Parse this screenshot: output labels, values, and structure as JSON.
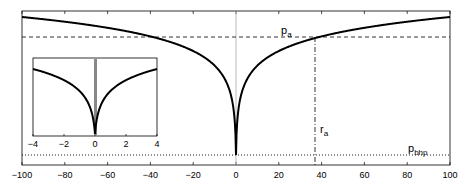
{
  "chart_data": [
    {
      "type": "line",
      "role": "main",
      "title": "",
      "xlabel": "",
      "ylabel": "",
      "xlim": [
        -100,
        100
      ],
      "x_ticks": [
        -100,
        -80,
        -60,
        -40,
        -20,
        0,
        20,
        40,
        60,
        80,
        100
      ],
      "x_tick_labels": [
        "−100",
        "−80",
        "−60",
        "−40",
        "−20",
        "0",
        "20",
        "40",
        "60",
        "80",
        "100"
      ],
      "y_ticks": [],
      "grid": false,
      "legend": null,
      "series": [
        {
          "name": "pressure profile",
          "style": "solid",
          "color": "#000000",
          "description": "logarithmic cone of depression symmetric about x=0, reaching minimum at x=0",
          "x": [
            -100,
            -80,
            -60,
            -40,
            -20,
            -10,
            -5,
            -1,
            0,
            1,
            5,
            10,
            20,
            40,
            60,
            80,
            100
          ],
          "y_rel": [
            0.92,
            0.86,
            0.78,
            0.67,
            0.5,
            0.35,
            0.2,
            0.05,
            0.0,
            0.05,
            0.2,
            0.35,
            0.5,
            0.67,
            0.78,
            0.86,
            0.92
          ]
        },
        {
          "name": "p_a",
          "style": "dashed",
          "color": "#000000",
          "y_rel": 0.83
        },
        {
          "name": "p_bhp",
          "style": "dotted",
          "color": "#000000",
          "y_rel": 0.06
        },
        {
          "name": "r_a",
          "style": "dashdot-vertical",
          "color": "#000000",
          "x": 37
        },
        {
          "name": "well axis",
          "style": "thin-vertical",
          "color": "#999999",
          "x": 0
        }
      ],
      "annotations": [
        {
          "text": "p",
          "sub": "a",
          "x": 23,
          "y_rel": 0.86
        },
        {
          "text": "r",
          "sub": "a",
          "x": 39,
          "y_rel": 0.18
        },
        {
          "text": "p",
          "sub": "bhp",
          "x": 84,
          "y_rel": 0.09
        }
      ]
    },
    {
      "type": "line",
      "role": "inset",
      "xlim": [
        -4,
        4
      ],
      "x_ticks": [
        -4,
        -2,
        0,
        2,
        4
      ],
      "x_tick_labels": [
        "−4",
        "−2",
        "0",
        "2",
        "4"
      ],
      "series": [
        {
          "name": "pressure profile (zoom)",
          "style": "solid",
          "color": "#000000",
          "x": [
            -4,
            -3,
            -2,
            -1,
            -0.5,
            -0.2,
            0,
            0.2,
            0.5,
            1,
            2,
            3,
            4
          ]
        },
        {
          "name": "wellbore",
          "style": "thick-vertical",
          "color": "#888888",
          "x": 0
        }
      ]
    }
  ],
  "labels": {
    "p_a": "p",
    "p_a_sub": "a",
    "r_a": "r",
    "r_a_sub": "a",
    "p_bhp": "p",
    "p_bhp_sub": "bhp"
  }
}
